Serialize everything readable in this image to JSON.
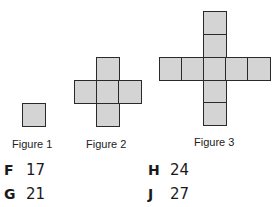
{
  "figures": [
    {
      "label": "Figure 1",
      "squares": 1
    },
    {
      "label": "Figure 2",
      "squares": 5
    },
    {
      "label": "Figure 3",
      "squares": 9
    }
  ],
  "choices": [
    {
      "letter": "F",
      "value": "17"
    },
    {
      "letter": "G",
      "value": "21"
    },
    {
      "letter": "H",
      "value": "24"
    },
    {
      "letter": "J",
      "value": "27"
    }
  ],
  "colors": {
    "square_fill": "#d4d4d4",
    "square_border": "#2a2a2a"
  }
}
